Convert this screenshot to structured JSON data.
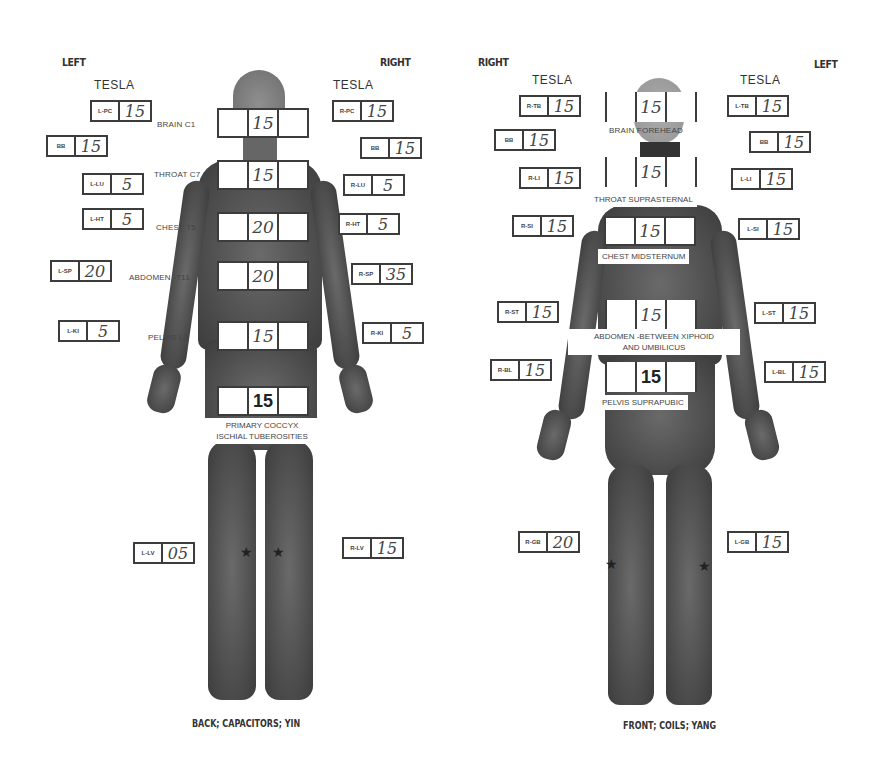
{
  "back_panel": {
    "side_left": "LEFT",
    "side_right": "RIGHT",
    "tesla_left": "TESLA",
    "tesla_right": "TESLA",
    "caption": "BACK; CAPACITORS; YIN",
    "left_points": [
      {
        "code": "L-PC",
        "value": "15"
      },
      {
        "code": "BB",
        "value": "15"
      },
      {
        "code": "L-LU",
        "value": "5"
      },
      {
        "code": "L-HT",
        "value": "5"
      },
      {
        "code": "L-SP",
        "value": "20"
      },
      {
        "code": "L-KI",
        "value": "5"
      },
      {
        "code": "L-LV",
        "value": "05"
      }
    ],
    "right_points": [
      {
        "code": "R-PC",
        "value": "15"
      },
      {
        "code": "BB",
        "value": "15"
      },
      {
        "code": "R-LU",
        "value": "5"
      },
      {
        "code": "R-HT",
        "value": "5"
      },
      {
        "code": "R-SP",
        "value": "35"
      },
      {
        "code": "R-KI",
        "value": "5"
      },
      {
        "code": "R-LV",
        "value": "15"
      }
    ],
    "center_regions": [
      {
        "label": "BRAIN C1",
        "value": "15"
      },
      {
        "label": "THROAT C7",
        "value": "15"
      },
      {
        "label": "CHEST T5",
        "value": "20"
      },
      {
        "label": "ABDOMEN -T11",
        "value": "20"
      },
      {
        "label": "PELVIS L2",
        "value": "15"
      },
      {
        "label_line1": "PRIMARY COCCYX",
        "label_line2": "ISCHIAL TUBEROSITIES",
        "value": "15"
      }
    ],
    "star_glyph": "★"
  },
  "front_panel": {
    "side_left": "RIGHT",
    "side_right": "LEFT",
    "tesla_left": "TESLA",
    "tesla_right": "TESLA",
    "caption": "FRONT; COILS; YANG",
    "left_points": [
      {
        "code": "R-TB",
        "value": "15"
      },
      {
        "code": "BB",
        "value": "15"
      },
      {
        "code": "R-LI",
        "value": "15"
      },
      {
        "code": "R-SI",
        "value": "15"
      },
      {
        "code": "R-ST",
        "value": "15"
      },
      {
        "code": "R-BL",
        "value": "15"
      },
      {
        "code": "R-GB",
        "value": "20"
      }
    ],
    "right_points": [
      {
        "code": "L-TB",
        "value": "15"
      },
      {
        "code": "BB",
        "value": "15"
      },
      {
        "code": "L-LI",
        "value": "15"
      },
      {
        "code": "L-SI",
        "value": "15"
      },
      {
        "code": "L-ST",
        "value": "15"
      },
      {
        "code": "L-BL",
        "value": "15"
      },
      {
        "code": "L-GB",
        "value": "15"
      }
    ],
    "center_regions": [
      {
        "label": "BRAIN FOREHEAD",
        "value": "15"
      },
      {
        "label": "THROAT SUPRASTERNAL",
        "value": "15"
      },
      {
        "label": "CHEST MIDSTERNUM",
        "value": "15"
      },
      {
        "label_line1": "ABDOMEN -BETWEEN XIPHOID",
        "label_line2": "AND UMBILICUS",
        "value": "15"
      },
      {
        "label": "PELVIS SUPRAPUBIC",
        "value": "15"
      }
    ],
    "star_glyph": "★"
  }
}
